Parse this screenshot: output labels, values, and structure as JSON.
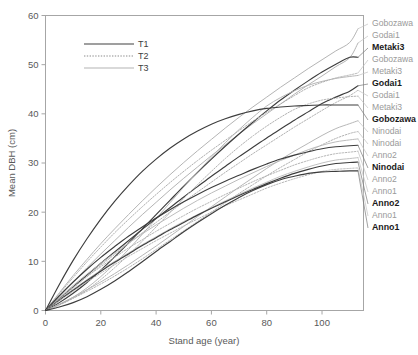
{
  "chart_data": {
    "type": "line",
    "title": "",
    "subtitle": "",
    "xlabel": "Stand age (year)",
    "ylabel": "Mean DBH (cm)",
    "xlim": [
      0,
      115
    ],
    "ylim": [
      0,
      60
    ],
    "xticks": [
      0,
      20,
      40,
      60,
      80,
      100
    ],
    "yticks": [
      0,
      10,
      20,
      30,
      40,
      50,
      60
    ],
    "grid": false,
    "legend_position": "top-left",
    "legend": [
      {
        "name": "T1",
        "style": "solid",
        "color": "#404040",
        "width": 1.2
      },
      {
        "name": "T2",
        "style": "dotted",
        "color": "#808080",
        "width": 1.0
      },
      {
        "name": "T3",
        "style": "solid",
        "color": "#b3b3b3",
        "width": 1.0
      }
    ],
    "x": [
      0,
      5,
      10,
      15,
      20,
      25,
      30,
      35,
      40,
      45,
      50,
      55,
      60,
      65,
      70,
      75,
      80,
      85,
      90,
      95,
      100,
      105,
      110,
      113
    ],
    "series": [
      {
        "name": "Gobozawa",
        "treatment": "T3",
        "label": "Gobozawa",
        "bold": false,
        "color": "#b0b0b0",
        "end_value": 57.3,
        "label_y": 57.3,
        "values": [
          0,
          3.6,
          7.1,
          10.4,
          13.6,
          16.6,
          19.5,
          22.3,
          25.0,
          27.6,
          30.1,
          32.5,
          34.8,
          37.1,
          39.3,
          41.4,
          43.4,
          45.4,
          47.3,
          49.2,
          51.0,
          52.8,
          54.5,
          57.3
        ]
      },
      {
        "name": "Godai1",
        "treatment": "T3",
        "label": "Godai1",
        "bold": false,
        "color": "#b0b0b0",
        "end_value": 54.4,
        "label_y": 54.4,
        "values": [
          0,
          2.9,
          5.8,
          8.7,
          11.5,
          14.2,
          16.9,
          19.5,
          22.0,
          24.5,
          26.9,
          29.2,
          31.5,
          33.7,
          35.9,
          38.0,
          40.0,
          42.0,
          44.0,
          45.9,
          47.7,
          49.6,
          51.4,
          54.4
        ]
      },
      {
        "name": "Metaki3",
        "treatment": "T1",
        "label": "Metaki3",
        "bold": true,
        "color": "#3d3d3d",
        "end_value": 51.5,
        "label_y": 51.5,
        "values": [
          0,
          1.6,
          3.5,
          5.7,
          8.2,
          10.9,
          13.7,
          16.6,
          19.5,
          22.4,
          25.3,
          28.1,
          30.8,
          33.4,
          35.9,
          38.3,
          40.6,
          42.8,
          44.8,
          46.7,
          48.5,
          50.1,
          51.5,
          51.5
        ]
      },
      {
        "name": "Gobozawa_T2",
        "treatment": "T2",
        "label": "Gobozawa",
        "bold": false,
        "color": "#ababab",
        "end_value": 48.3,
        "label_y": 48.3,
        "values": [
          0,
          3.4,
          6.7,
          9.9,
          12.9,
          15.8,
          18.5,
          21.1,
          23.6,
          26.0,
          28.3,
          30.5,
          32.6,
          34.6,
          36.6,
          38.5,
          40.3,
          42.0,
          43.7,
          45.3,
          46.4,
          47.3,
          47.9,
          48.3
        ]
      },
      {
        "name": "Metaki3_T3",
        "treatment": "T3",
        "label": "Metaki3",
        "bold": false,
        "color": "#b3b3b3",
        "end_value": 47.8,
        "label_y": 47.8,
        "values": [
          0,
          1.2,
          2.7,
          4.6,
          6.9,
          9.5,
          12.4,
          15.5,
          18.7,
          21.9,
          25.1,
          28.2,
          31.2,
          34.1,
          36.8,
          39.3,
          41.6,
          43.3,
          44.7,
          45.8,
          46.6,
          47.2,
          47.6,
          47.8
        ]
      },
      {
        "name": "Godai1_T1",
        "treatment": "T1",
        "label": "Godai1",
        "bold": true,
        "color": "#3d3d3d",
        "end_value": 45.7,
        "label_y": 45.7,
        "values": [
          0,
          2.4,
          4.8,
          7.2,
          9.6,
          11.9,
          14.2,
          16.5,
          18.7,
          20.9,
          23.1,
          25.2,
          27.3,
          29.3,
          31.3,
          33.2,
          35.1,
          36.9,
          38.7,
          40.4,
          42.1,
          43.4,
          44.6,
          45.7
        ]
      },
      {
        "name": "Godai1_T2",
        "treatment": "T2",
        "label": "Godai1",
        "bold": false,
        "color": "#adadad",
        "end_value": 44.8,
        "label_y": 44.8,
        "values": [
          0,
          2.3,
          4.6,
          6.9,
          9.2,
          11.4,
          13.6,
          15.8,
          17.9,
          20.0,
          22.1,
          24.1,
          26.1,
          28.1,
          30.0,
          31.9,
          33.7,
          35.5,
          37.3,
          39.0,
          40.7,
          42.3,
          43.7,
          44.8
        ]
      },
      {
        "name": "Metaki3_T2",
        "treatment": "T2",
        "label": "Metaki3",
        "bold": false,
        "color": "#adadad",
        "end_value": 43.6,
        "label_y": 43.6,
        "values": [
          0,
          1.1,
          2.5,
          4.2,
          6.3,
          8.7,
          11.3,
          14.1,
          17.0,
          19.9,
          22.8,
          25.6,
          28.3,
          30.9,
          33.3,
          35.5,
          37.5,
          39.3,
          40.9,
          42.0,
          42.8,
          43.2,
          43.5,
          43.6
        ]
      },
      {
        "name": "Gobozawa_T1",
        "treatment": "T1",
        "label": "Gobozawa",
        "bold": true,
        "color": "#3d3d3d",
        "end_value": 41.8,
        "label_y": 41.8,
        "values": [
          0,
          5.3,
          10.2,
          14.6,
          18.6,
          22.2,
          25.4,
          28.3,
          30.8,
          33.0,
          34.9,
          36.5,
          37.9,
          39.0,
          39.9,
          40.6,
          41.1,
          41.4,
          41.6,
          41.7,
          41.8,
          41.8,
          41.8,
          41.8
        ]
      },
      {
        "name": "Ninodai_T3",
        "treatment": "T3",
        "label": "Ninodai",
        "bold": false,
        "color": "#b3b3b3",
        "end_value": 38.6,
        "label_y": 38.6,
        "values": [
          0,
          1.3,
          2.7,
          4.2,
          5.8,
          7.5,
          9.3,
          11.2,
          13.1,
          15.1,
          17.1,
          19.1,
          21.1,
          23.1,
          25.1,
          27.0,
          28.9,
          30.7,
          32.4,
          34.0,
          35.6,
          37.0,
          38.0,
          38.6
        ]
      },
      {
        "name": "Ninodai_T2",
        "treatment": "T2",
        "label": "Ninodai",
        "bold": false,
        "color": "#adadad",
        "end_value": 36.4,
        "label_y": 36.4,
        "values": [
          0,
          1.2,
          2.5,
          3.9,
          5.4,
          7.0,
          8.7,
          10.5,
          12.4,
          14.3,
          16.2,
          18.1,
          20.0,
          21.9,
          23.8,
          25.6,
          27.4,
          29.1,
          30.7,
          32.3,
          33.7,
          35.0,
          36.0,
          36.4
        ]
      },
      {
        "name": "Anno2_T3",
        "treatment": "T3",
        "label": "Anno2",
        "bold": false,
        "color": "#b8b8b8",
        "end_value": 34.9,
        "label_y": 34.9,
        "values": [
          0,
          2.6,
          5.1,
          7.4,
          9.6,
          11.7,
          13.7,
          15.6,
          17.4,
          19.1,
          20.8,
          22.4,
          23.9,
          25.3,
          26.7,
          28.0,
          29.3,
          30.5,
          31.6,
          32.7,
          33.6,
          34.3,
          34.7,
          34.9
        ]
      },
      {
        "name": "Ninodai_T1",
        "treatment": "T1",
        "label": "Ninodai",
        "bold": true,
        "color": "#3d3d3d",
        "end_value": 33.6,
        "label_y": 33.6,
        "values": [
          0,
          3.0,
          5.8,
          8.4,
          10.8,
          13.0,
          15.1,
          17.0,
          18.8,
          20.5,
          22.1,
          23.6,
          25.0,
          26.3,
          27.5,
          28.7,
          29.8,
          30.8,
          31.6,
          32.3,
          32.9,
          33.3,
          33.5,
          33.6
        ]
      },
      {
        "name": "Anno2_T2",
        "treatment": "T2",
        "label": "Anno2",
        "bold": false,
        "color": "#b0b0b0",
        "end_value": 32.4,
        "label_y": 32.4,
        "values": [
          0,
          2.4,
          4.7,
          6.9,
          8.9,
          10.8,
          12.7,
          14.4,
          16.1,
          17.7,
          19.3,
          20.8,
          22.2,
          23.6,
          24.9,
          26.2,
          27.4,
          28.5,
          29.6,
          30.5,
          31.3,
          31.9,
          32.2,
          32.4
        ]
      },
      {
        "name": "Anno1_T3",
        "treatment": "T3",
        "label": "Anno1",
        "bold": false,
        "color": "#bdbdbd",
        "end_value": 31.1,
        "label_y": 31.1,
        "values": [
          0,
          2.2,
          4.3,
          6.3,
          8.2,
          10.0,
          11.7,
          13.4,
          15.0,
          16.6,
          18.1,
          19.5,
          20.9,
          22.3,
          23.6,
          24.9,
          26.1,
          27.3,
          28.3,
          29.2,
          30.0,
          30.6,
          30.9,
          31.1
        ]
      },
      {
        "name": "Anno2_T1",
        "treatment": "T1",
        "label": "Anno2",
        "bold": true,
        "color": "#3d3d3d",
        "end_value": 30.2,
        "label_y": 30.2,
        "values": [
          0,
          2.1,
          4.1,
          6.1,
          8.0,
          9.8,
          11.5,
          13.2,
          14.8,
          16.4,
          17.9,
          19.4,
          20.8,
          22.1,
          23.4,
          24.6,
          25.8,
          26.9,
          27.9,
          28.7,
          29.4,
          29.9,
          30.1,
          30.2
        ]
      },
      {
        "name": "Anno1_T2",
        "treatment": "T2",
        "label": "Anno1",
        "bold": false,
        "color": "#b3b3b3",
        "end_value": 29.0,
        "label_y": 29.0,
        "values": [
          0,
          2.0,
          3.9,
          5.8,
          7.6,
          9.3,
          11.0,
          12.6,
          14.2,
          15.7,
          17.2,
          18.6,
          20.0,
          21.3,
          22.5,
          23.7,
          24.9,
          25.9,
          26.8,
          27.6,
          28.3,
          28.7,
          28.9,
          29.0
        ]
      },
      {
        "name": "Anno1_T1",
        "treatment": "T1",
        "label": "Anno1",
        "bold": true,
        "color": "#3d3d3d",
        "end_value": 28.4,
        "label_y": 28.4,
        "values": [
          0,
          0.7,
          1.6,
          2.8,
          4.3,
          6.0,
          7.9,
          9.9,
          12.0,
          14.0,
          16.0,
          17.9,
          19.7,
          21.4,
          23.0,
          24.4,
          25.6,
          26.6,
          27.3,
          27.9,
          28.2,
          28.3,
          28.4,
          28.4
        ]
      }
    ],
    "end_labels": [
      {
        "text": "Gobozawa",
        "bold": false,
        "y_data": 57.3,
        "label_px_y": 24
      },
      {
        "text": "Godai1",
        "bold": false,
        "y_data": 54.4,
        "label_px_y": 36
      },
      {
        "text": "Metaki3",
        "bold": true,
        "y_data": 51.5,
        "label_px_y": 48
      },
      {
        "text": "Gobozawa",
        "bold": false,
        "y_data": 48.3,
        "label_px_y": 60
      },
      {
        "text": "Metaki3",
        "bold": false,
        "y_data": 47.8,
        "label_px_y": 72
      },
      {
        "text": "Godai1",
        "bold": true,
        "y_data": 45.7,
        "label_px_y": 84
      },
      {
        "text": "Godai1",
        "bold": false,
        "y_data": 44.8,
        "label_px_y": 96
      },
      {
        "text": "Metaki3",
        "bold": false,
        "y_data": 43.6,
        "label_px_y": 108
      },
      {
        "text": "Gobozawa",
        "bold": true,
        "y_data": 41.8,
        "label_px_y": 120
      },
      {
        "text": "Ninodai",
        "bold": false,
        "y_data": 38.6,
        "label_px_y": 132
      },
      {
        "text": "Ninodai",
        "bold": false,
        "y_data": 36.4,
        "label_px_y": 144
      },
      {
        "text": "Anno2",
        "bold": false,
        "y_data": 34.9,
        "label_px_y": 156
      },
      {
        "text": "Ninodai",
        "bold": true,
        "y_data": 33.6,
        "label_px_y": 168
      },
      {
        "text": "Anno2",
        "bold": false,
        "y_data": 32.4,
        "label_px_y": 180
      },
      {
        "text": "Anno1",
        "bold": false,
        "y_data": 31.1,
        "label_px_y": 192
      },
      {
        "text": "Anno2",
        "bold": true,
        "y_data": 30.2,
        "label_px_y": 204
      },
      {
        "text": "Anno1",
        "bold": false,
        "y_data": 29.0,
        "label_px_y": 216
      },
      {
        "text": "Anno1",
        "bold": true,
        "y_data": 28.4,
        "label_px_y": 228
      }
    ]
  },
  "axes": {
    "x_title": "Stand age (year)",
    "y_title": "Mean DBH (cm)",
    "x_tick_labels": [
      "0",
      "20",
      "40",
      "60",
      "80",
      "100"
    ],
    "y_tick_labels": [
      "0",
      "10",
      "20",
      "30",
      "40",
      "50",
      "60"
    ]
  },
  "legend": {
    "items": [
      {
        "label": "T1"
      },
      {
        "label": "T2"
      },
      {
        "label": "T3"
      }
    ]
  },
  "colors": {
    "frame": "#a6a6a6",
    "text": "#595959",
    "t1": "#3d3d3d",
    "t2": "#9e9e9e",
    "t3": "#b3b3b3",
    "background": "#ffffff"
  }
}
